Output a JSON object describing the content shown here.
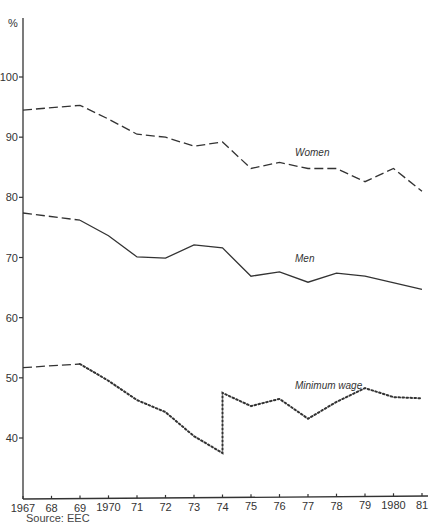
{
  "chart_data": {
    "type": "line",
    "title": "",
    "xlabel": "",
    "ylabel": "%",
    "ylim": [
      34,
      110
    ],
    "yticks": [
      40,
      50,
      60,
      70,
      80,
      90,
      100
    ],
    "x": [
      1967,
      1969,
      1970,
      1971,
      1972,
      1973,
      1974,
      1975,
      1976,
      1977,
      1978,
      1979,
      1980,
      1981
    ],
    "xtick_labels": [
      "1967",
      "68",
      "69",
      "1970",
      "71",
      "72",
      "73",
      "74",
      "75",
      "76",
      "77",
      "78",
      "79",
      "1980",
      "81"
    ],
    "xtick_years": [
      1967,
      1968,
      1969,
      1970,
      1971,
      1972,
      1973,
      1974,
      1975,
      1976,
      1977,
      1978,
      1979,
      1980,
      1981
    ],
    "grid": false,
    "legend": "inline labels",
    "series": [
      {
        "name": "Women",
        "style": "dashed",
        "points": [
          [
            1967,
            94.5
          ],
          [
            1969,
            95.3
          ],
          [
            1970,
            93.0
          ],
          [
            1971,
            90.5
          ],
          [
            1972,
            90.0
          ],
          [
            1973,
            88.5
          ],
          [
            1974,
            89.2
          ],
          [
            1975,
            84.8
          ],
          [
            1976,
            85.8
          ],
          [
            1977,
            84.8
          ],
          [
            1978,
            84.8
          ],
          [
            1979,
            82.6
          ],
          [
            1980,
            84.8
          ],
          [
            1981,
            81.0
          ]
        ]
      },
      {
        "name": "Men",
        "style": "dashed-then-solid",
        "points": [
          [
            1967,
            77.4
          ],
          [
            1969,
            76.2
          ],
          [
            1970,
            73.6
          ],
          [
            1971,
            70.1
          ],
          [
            1972,
            69.9
          ],
          [
            1973,
            72.1
          ],
          [
            1974,
            71.6
          ],
          [
            1975,
            66.9
          ],
          [
            1976,
            67.6
          ],
          [
            1977,
            65.9
          ],
          [
            1978,
            67.4
          ],
          [
            1979,
            66.9
          ],
          [
            1981,
            64.7
          ]
        ]
      },
      {
        "name": "Minimum wage",
        "style": "dashed-then-dotted",
        "points": [
          [
            1967,
            51.7
          ],
          [
            1969,
            52.3
          ],
          [
            1970,
            49.5
          ],
          [
            1971,
            46.3
          ],
          [
            1972,
            44.3
          ],
          [
            1973,
            40.3
          ],
          [
            1974,
            37.5
          ],
          [
            1974,
            47.5
          ],
          [
            1975,
            45.3
          ],
          [
            1976,
            46.5
          ],
          [
            1977,
            43.2
          ],
          [
            1978,
            46.0
          ],
          [
            1979,
            48.3
          ],
          [
            1980,
            46.8
          ],
          [
            1981,
            46.6
          ]
        ]
      }
    ],
    "annotations": [
      {
        "text": "Women",
        "x": 1977,
        "y": 87.5
      },
      {
        "text": "Men",
        "x": 1977,
        "y": 70.0
      },
      {
        "text": "Minimum wage",
        "x": 1977,
        "y": 48.8
      }
    ]
  },
  "axis": {
    "y_unit": "%",
    "y_labels": [
      "100",
      "90",
      "80",
      "70",
      "60",
      "50",
      "40"
    ]
  },
  "labels": {
    "women": "Women",
    "men": "Men",
    "minimum_wage": "Minimum wage"
  },
  "source": "Source: EEC"
}
